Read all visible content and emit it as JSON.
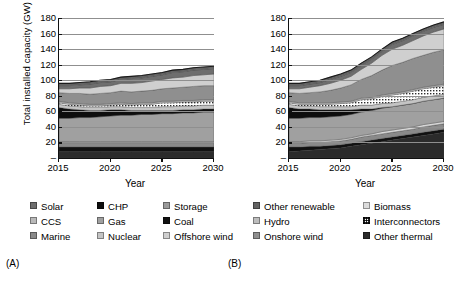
{
  "figure": {
    "panel_labels": {
      "a": "(A)",
      "b": "(B)"
    }
  },
  "axes": {
    "ylabel": "Total installed capacity (GW)",
    "xlabel": "Year",
    "yticks": [
      "180",
      "160",
      "140",
      "120",
      "100",
      "80",
      "60",
      "40",
      "20",
      "–"
    ],
    "xticks": [
      "2015",
      "2020",
      "2025",
      "2030"
    ],
    "ylim": [
      0,
      180
    ],
    "xlim": [
      2015,
      2030
    ]
  },
  "legend": {
    "columns": [
      {
        "items": [
          {
            "label": "Solar",
            "color": "#6e6e6e",
            "pattern": "solid"
          },
          {
            "label": "CCS",
            "color": "#b9b9b9",
            "pattern": "solid"
          },
          {
            "label": "Marine",
            "color": "#8a8a8a",
            "pattern": "solid"
          }
        ]
      },
      {
        "items": [
          {
            "label": "CHP",
            "color": "#0d0d0d",
            "pattern": "solid"
          },
          {
            "label": "Gas",
            "color": "#a0a0a0",
            "pattern": "solid"
          },
          {
            "label": "Nuclear",
            "color": "#c4c4c4",
            "pattern": "solid"
          }
        ]
      },
      {
        "items": [
          {
            "label": "Storage",
            "color": "#9a9a9a",
            "pattern": "solid"
          },
          {
            "label": "Coal",
            "color": "#111111",
            "pattern": "solid"
          },
          {
            "label": "Offshore wind",
            "color": "#cfcfcf",
            "pattern": "solid"
          }
        ]
      },
      {
        "items": [
          {
            "label": "Other renewable",
            "color": "#636363",
            "pattern": "solid"
          },
          {
            "label": "Hydro",
            "color": "#bdbdbd",
            "pattern": "solid"
          },
          {
            "label": "Onshore wind",
            "color": "#8f8f8f",
            "pattern": "solid"
          }
        ]
      },
      {
        "items": [
          {
            "label": "Biomass",
            "color": "#dcdcdc",
            "pattern": "solid"
          },
          {
            "label": "Interconnectors",
            "color": "#ffffff",
            "pattern": "hatch"
          },
          {
            "label": "Other thermal",
            "color": "#2b2b2b",
            "pattern": "solid"
          }
        ]
      }
    ]
  },
  "chart_data": {
    "type": "area",
    "title": "",
    "xlabel": "Year",
    "ylabel": "Total installed capacity (GW)",
    "xlim": [
      2015,
      2030
    ],
    "ylim": [
      0,
      180
    ],
    "grid": true,
    "legend_position": "below",
    "x": [
      2015,
      2016,
      2017,
      2018,
      2019,
      2020,
      2021,
      2022,
      2023,
      2024,
      2025,
      2026,
      2027,
      2028,
      2029,
      2030
    ],
    "panels": [
      {
        "label": "(A)",
        "total": [
          96,
          96,
          97,
          98,
          99,
          100,
          103,
          105,
          104,
          106,
          108,
          110,
          111,
          112,
          113,
          114
        ],
        "series": [
          {
            "name": "Other thermal",
            "color": "#2b2b2b",
            "values": [
              8,
              8,
              8,
              8,
              8,
              8,
              8,
              8,
              8,
              8,
              8,
              8,
              8,
              8,
              8,
              8
            ]
          },
          {
            "name": "Coal",
            "color": "#111111",
            "values": [
              6,
              6,
              6,
              6,
              6,
              6,
              6,
              6,
              6,
              6,
              6,
              6,
              6,
              6,
              6,
              6
            ]
          },
          {
            "name": "Marine",
            "color": "#8a8a8a",
            "values": [
              5,
              5,
              5,
              5,
              5,
              5,
              5,
              5,
              5,
              5,
              5,
              5,
              5,
              5,
              5,
              5
            ]
          },
          {
            "name": "Storage",
            "color": "#d8d8d8",
            "values": [
              2,
              2,
              2,
              2,
              2,
              2,
              2,
              2,
              2,
              2,
              2,
              2,
              2,
              2,
              2,
              2
            ]
          },
          {
            "name": "Gas",
            "color": "#a0a0a0",
            "values": [
              30,
              30,
              31,
              31,
              32,
              33,
              34,
              34,
              35,
              35,
              36,
              36,
              37,
              37,
              38,
              38
            ]
          },
          {
            "name": "CHP",
            "color": "#0d0d0d",
            "values": [
              14,
              12,
              10,
              9,
              8,
              8,
              7,
              6,
              5,
              5,
              4,
              4,
              4,
              4,
              4,
              4
            ]
          },
          {
            "name": "Nuclear",
            "color": "#c4c4c4",
            "values": [
              4,
              4,
              4,
              4,
              4,
              4,
              4,
              4,
              4,
              4,
              5,
              5,
              5,
              5,
              5,
              5
            ]
          },
          {
            "name": "Interconnectors",
            "color": "#ffffff",
            "values": [
              2,
              2,
              2,
              2,
              2,
              2,
              3,
              3,
              4,
              4,
              5,
              5,
              5,
              5,
              5,
              5
            ]
          },
          {
            "name": "Hydro",
            "color": "#bdbdbd",
            "values": [
              2,
              2,
              2,
              2,
              2,
              2,
              2,
              2,
              2,
              2,
              2,
              2,
              2,
              2,
              2,
              2
            ]
          },
          {
            "name": "Onshore wind",
            "color": "#8f8f8f",
            "values": [
              11,
              12,
              13,
              13,
              14,
              14,
              15,
              15,
              15,
              16,
              16,
              17,
              17,
              18,
              18,
              18
            ]
          },
          {
            "name": "Offshore wind",
            "color": "#cfcfcf",
            "values": [
              5,
              6,
              7,
              8,
              9,
              9,
              10,
              11,
              11,
              12,
              12,
              13,
              13,
              14,
              14,
              15
            ]
          },
          {
            "name": "Solar",
            "color": "#6e6e6e",
            "values": [
              4,
              4,
              4,
              5,
              5,
              5,
              5,
              6,
              6,
              6,
              6,
              7,
              7,
              7,
              7,
              7
            ]
          },
          {
            "name": "Other renewable",
            "color": "#636363",
            "values": [
              3,
              3,
              3,
              3,
              3,
              3,
              3,
              3,
              3,
              3,
              3,
              3,
              3,
              3,
              3,
              3
            ]
          }
        ]
      },
      {
        "label": "(B)",
        "total": [
          96,
          96,
          97,
          98,
          100,
          102,
          107,
          114,
          122,
          132,
          141,
          146,
          151,
          156,
          161,
          165
        ],
        "series": [
          {
            "name": "Other thermal",
            "color": "#2b2b2b",
            "values": [
              8,
              9,
              10,
              11,
              12,
              13,
              15,
              17,
              19,
              21,
              23,
              25,
              27,
              29,
              31,
              33
            ]
          },
          {
            "name": "Coal",
            "color": "#111111",
            "values": [
              6,
              5,
              5,
              4,
              4,
              4,
              4,
              4,
              4,
              4,
              4,
              4,
              4,
              4,
              4,
              4
            ]
          },
          {
            "name": "Marine",
            "color": "#8a8a8a",
            "values": [
              5,
              5,
              5,
              5,
              5,
              5,
              5,
              6,
              6,
              6,
              6,
              6,
              6,
              7,
              7,
              7
            ]
          },
          {
            "name": "Storage",
            "color": "#d8d8d8",
            "values": [
              2,
              2,
              2,
              2,
              2,
              2,
              2,
              2,
              2,
              3,
              3,
              3,
              3,
              3,
              3,
              3
            ]
          },
          {
            "name": "Gas",
            "color": "#a0a0a0",
            "values": [
              30,
              30,
              30,
              30,
              30,
              30,
              30,
              30,
              30,
              30,
              30,
              30,
              30,
              30,
              30,
              30
            ]
          },
          {
            "name": "CHP",
            "color": "#0d0d0d",
            "values": [
              14,
              12,
              11,
              10,
              9,
              8,
              6,
              4,
              2,
              1,
              0,
              0,
              0,
              0,
              0,
              0
            ]
          },
          {
            "name": "Nuclear",
            "color": "#c4c4c4",
            "values": [
              4,
              4,
              4,
              4,
              4,
              4,
              4,
              5,
              5,
              5,
              5,
              5,
              5,
              5,
              5,
              5
            ]
          },
          {
            "name": "Interconnectors",
            "color": "#ffffff",
            "values": [
              2,
              2,
              2,
              3,
              3,
              4,
              5,
              7,
              8,
              9,
              10,
              10,
              11,
              11,
              11,
              11
            ]
          },
          {
            "name": "Hydro",
            "color": "#bdbdbd",
            "values": [
              2,
              2,
              2,
              2,
              2,
              2,
              2,
              2,
              2,
              2,
              2,
              2,
              2,
              2,
              2,
              2
            ]
          },
          {
            "name": "Onshore wind",
            "color": "#8f8f8f",
            "values": [
              11,
              12,
              13,
              14,
              16,
              18,
              21,
              24,
              28,
              32,
              36,
              38,
              40,
              41,
              43,
              44
            ]
          },
          {
            "name": "Offshore wind",
            "color": "#cfcfcf",
            "values": [
              5,
              6,
              7,
              8,
              9,
              10,
              11,
              13,
              16,
              19,
              21,
              22,
              23,
              25,
              26,
              27
            ]
          },
          {
            "name": "Solar",
            "color": "#6e6e6e",
            "values": [
              4,
              4,
              4,
              4,
              5,
              5,
              5,
              5,
              5,
              5,
              6,
              6,
              6,
              6,
              6,
              6
            ]
          },
          {
            "name": "Other renewable",
            "color": "#636363",
            "values": [
              3,
              3,
              3,
              3,
              3,
              3,
              3,
              3,
              3,
              3,
              3,
              3,
              3,
              3,
              3,
              3
            ]
          }
        ]
      }
    ]
  }
}
